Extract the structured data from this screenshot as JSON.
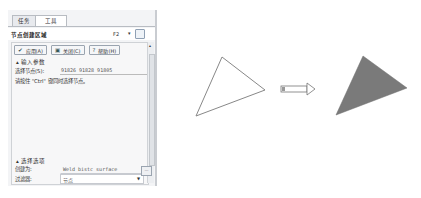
{
  "panel": {
    "tabs": [
      {
        "label": "任务",
        "active": false
      },
      {
        "label": "工具",
        "active": true
      }
    ],
    "title": "节点创建区域",
    "hotkey": "F2",
    "toolbar": {
      "apply_label": "应用(A)",
      "close_label": "关闭(C)",
      "help_label": "帮助(H)"
    },
    "input_section": {
      "header": "输入参数",
      "select_nodes_label": "选择节点(S):",
      "select_nodes_value": "91826 91828 91805",
      "hint": "请按住 \"Ctrl\" 键同时选择节点。"
    },
    "options_section": {
      "header": "选择选项",
      "create_as_label": "创建为:",
      "create_as_value": "Weld bistc surface",
      "filter_label": "过滤器:",
      "filter_value": "节点"
    }
  },
  "diagram": {
    "left_triangle": {
      "points": [
        [
          222,
          57
        ],
        [
          265,
          90
        ],
        [
          196,
          116
        ]
      ],
      "fill": "none",
      "stroke": "#888888"
    },
    "arrow": {
      "x1": 281,
      "x2": 315,
      "y": 89
    },
    "right_triangle": {
      "points": [
        [
          363,
          56
        ],
        [
          407,
          88
        ],
        [
          336,
          115
        ]
      ],
      "fill": "#7a7a7a"
    }
  }
}
